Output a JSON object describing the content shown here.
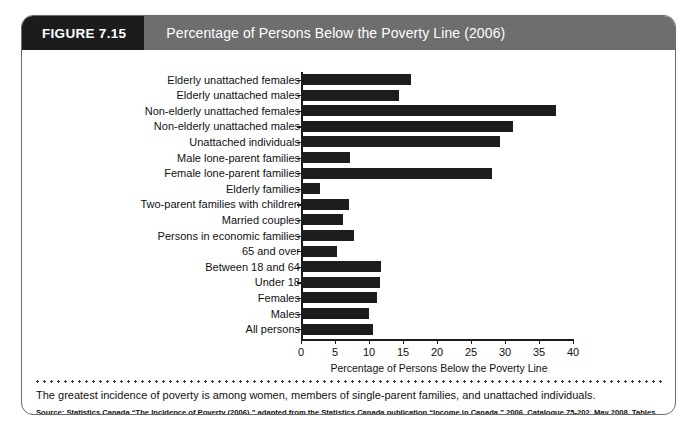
{
  "header": {
    "figure_number": "FIGURE 7.15",
    "title": "Percentage of Persons Below the Poverty Line (2006)"
  },
  "caption": "The greatest incidence of poverty is among women, members of single-parent families, and unattached individuals.",
  "source": "Source: Statistics Canada “The Incidence of Poverty (2006),” adapted from the Statistics Canada publication “Income in Canada,” 2006, Catalogue 75-202, May 2008, Tables 11-1, 13-1.",
  "chart_data": {
    "type": "bar",
    "orientation": "horizontal",
    "title": "Percentage of Persons Below the Poverty Line (2006)",
    "xlabel": "Percentage of Persons Below the Poverty Line",
    "ylabel": "",
    "xlim": [
      0,
      40
    ],
    "xticks": [
      0,
      5,
      10,
      15,
      20,
      25,
      30,
      35,
      40
    ],
    "grid": false,
    "legend": false,
    "bar_color": "#1d1d1d",
    "categories": [
      "Elderly unattached females",
      "Elderly unattached males",
      "Non-elderly unattached females",
      "Non-elderly unattached males",
      "Unattached individuals",
      "Male lone-parent families",
      "Female lone-parent families",
      "Elderly families",
      "Two-parent families with children",
      "Married couples",
      "Persons in economic families",
      "65 and over",
      "Between 18 and 64",
      "Under 18",
      "Females",
      "Males",
      "All persons"
    ],
    "values": [
      16.0,
      14.3,
      37.3,
      31.0,
      29.1,
      7.1,
      28.0,
      2.6,
      6.9,
      6.0,
      7.6,
      5.2,
      11.6,
      11.5,
      11.0,
      9.8,
      10.5
    ]
  }
}
